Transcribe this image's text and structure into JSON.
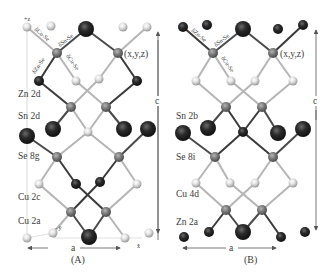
{
  "figure": {
    "panels": [
      {
        "id": "A",
        "caption": "(A)",
        "axis_z_label": "+z",
        "coord_label": "(x,y,z)",
        "lattice_a_label": "a",
        "lattice_c_label": "c",
        "axis_y_label": "- ŷ",
        "axis_x_label": "x̂",
        "bond_labels": [
          "δCu-Se",
          "δSn-Se",
          "δZn-Se",
          "δCu-Se"
        ],
        "site_labels": [
          "Zn 2d",
          "Sn 2d",
          "Se 8g",
          "Cu 2c",
          "Cu 2a"
        ]
      },
      {
        "id": "B",
        "caption": "(B)",
        "coord_label": "(x,y,z)",
        "lattice_a_label": "a",
        "lattice_c_label": "c",
        "bond_labels": [
          "δZn-Se",
          "δSn-Se",
          "δCu-Se"
        ],
        "site_labels": [
          "Sn 2b",
          "Se 8i",
          "Cu 4d",
          "Zn 2a"
        ]
      }
    ],
    "legend_colors": {
      "Cu": "#c9c9c9",
      "Se": "#7a7a7a",
      "Zn": "#1e1e1e",
      "Sn": "#2e2e2e",
      "bond_dark": "#4a4a4a",
      "bond_light": "#b0b0b0"
    }
  }
}
